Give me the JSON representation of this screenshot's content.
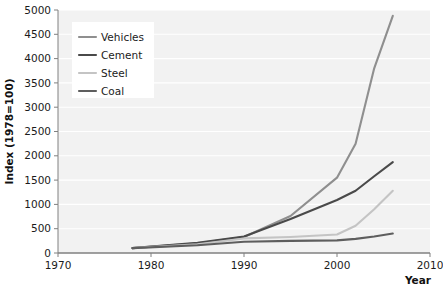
{
  "chart_data": {
    "type": "line",
    "title": "",
    "xlabel": "Year",
    "ylabel": "Index (1978=100)",
    "xlim": [
      1970,
      2010
    ],
    "ylim": [
      0,
      5000
    ],
    "xticks": [
      1970,
      1980,
      1990,
      2000,
      2010
    ],
    "yticks": [
      0,
      500,
      1000,
      1500,
      2000,
      2500,
      3000,
      3500,
      4000,
      4500,
      5000
    ],
    "grid": true,
    "grid_orientation": "horizontal",
    "legend_position": "top-left",
    "series": [
      {
        "name": "Vehicles",
        "color": "#8f8f8f",
        "x": [
          1978,
          1985,
          1990,
          1995,
          2000,
          2002,
          2004,
          2006
        ],
        "values": [
          100,
          200,
          330,
          760,
          1550,
          2250,
          3800,
          4880
        ]
      },
      {
        "name": "Cement",
        "color": "#4a4a4a",
        "x": [
          1978,
          1985,
          1990,
          1995,
          2000,
          2002,
          2004,
          2006
        ],
        "values": [
          100,
          210,
          340,
          700,
          1090,
          1280,
          1580,
          1870
        ]
      },
      {
        "name": "Steel",
        "color": "#c4c4c4",
        "x": [
          1978,
          1985,
          1990,
          1995,
          2000,
          2002,
          2004,
          2006
        ],
        "values": [
          100,
          180,
          300,
          330,
          380,
          560,
          900,
          1280
        ]
      },
      {
        "name": "Coal",
        "color": "#5e5e5e",
        "x": [
          1978,
          1985,
          1990,
          1995,
          2000,
          2002,
          2004,
          2006
        ],
        "values": [
          100,
          160,
          230,
          250,
          260,
          290,
          340,
          400
        ]
      }
    ]
  },
  "style": {
    "plot_background": "#f2f2f2",
    "gridline_color": "#ffffff",
    "axis_color": "#808080",
    "legend_background": "#ffffff",
    "page_background": "#ffffff"
  },
  "legend": {
    "items": [
      {
        "label": "Vehicles",
        "color": "#8f8f8f"
      },
      {
        "label": "Cement",
        "color": "#4a4a4a"
      },
      {
        "label": "Steel",
        "color": "#c4c4c4"
      },
      {
        "label": "Coal",
        "color": "#5e5e5e"
      }
    ]
  }
}
